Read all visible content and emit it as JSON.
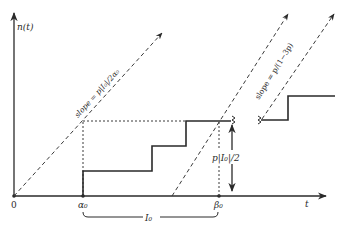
{
  "diagram": {
    "y_axis_label": "n(t)",
    "x_axis_label": "t",
    "origin_label": "0",
    "alpha_label": "α₀",
    "beta_label": "β₀",
    "interval_label": "I₀",
    "height_label": "p|I₀|/2",
    "slope1_label": "slope = p|I₀|/2α₀",
    "slope2_label": "slope = p/(1−3p)",
    "colors": {
      "ink": "#2a2a2a",
      "background": "#ffffff"
    }
  }
}
